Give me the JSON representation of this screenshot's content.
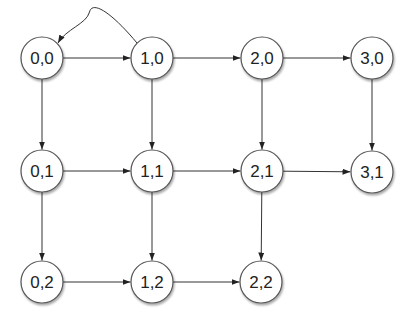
{
  "diagram": {
    "type": "directed-grid-graph",
    "colors": {
      "node_fill": "#ffffff",
      "node_stroke": "#555555",
      "edge": "#333333",
      "text": "#222222"
    },
    "node_radius": 21,
    "nodes": [
      {
        "id": "0,0",
        "label": "0,0",
        "x": 42,
        "y": 58
      },
      {
        "id": "1,0",
        "label": "1,0",
        "x": 152,
        "y": 58
      },
      {
        "id": "2,0",
        "label": "2,0",
        "x": 262,
        "y": 58
      },
      {
        "id": "3,0",
        "label": "3,0",
        "x": 372,
        "y": 58
      },
      {
        "id": "0,1",
        "label": "0,1",
        "x": 42,
        "y": 171
      },
      {
        "id": "1,1",
        "label": "1,1",
        "x": 152,
        "y": 171
      },
      {
        "id": "2,1",
        "label": "2,1",
        "x": 262,
        "y": 171
      },
      {
        "id": "3,1",
        "label": "3,1",
        "x": 372,
        "y": 172
      },
      {
        "id": "0,2",
        "label": "0,2",
        "x": 42,
        "y": 282
      },
      {
        "id": "1,2",
        "label": "1,2",
        "x": 152,
        "y": 282
      },
      {
        "id": "2,2",
        "label": "2,2",
        "x": 261,
        "y": 282
      }
    ],
    "edges": [
      {
        "from": "0,0",
        "to": "1,0"
      },
      {
        "from": "1,0",
        "to": "2,0"
      },
      {
        "from": "2,0",
        "to": "3,0"
      },
      {
        "from": "0,1",
        "to": "1,1"
      },
      {
        "from": "1,1",
        "to": "2,1"
      },
      {
        "from": "2,1",
        "to": "3,1"
      },
      {
        "from": "0,2",
        "to": "1,2"
      },
      {
        "from": "1,2",
        "to": "2,2"
      },
      {
        "from": "0,0",
        "to": "0,1"
      },
      {
        "from": "1,0",
        "to": "1,1"
      },
      {
        "from": "2,0",
        "to": "2,1"
      },
      {
        "from": "3,0",
        "to": "3,1"
      },
      {
        "from": "0,1",
        "to": "0,2"
      },
      {
        "from": "1,1",
        "to": "1,2"
      },
      {
        "from": "2,1",
        "to": "2,2"
      },
      {
        "from": "1,0",
        "to": "0,0",
        "curved": true
      }
    ]
  }
}
